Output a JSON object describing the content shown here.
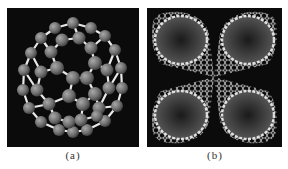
{
  "figure": {
    "panels": [
      {
        "id": "a",
        "caption": "(a)",
        "subject": "C60 fullerene ball-and-stick model",
        "background": "#0b0b0b",
        "atom_color": "#7a7a7a",
        "bond_color": "#e6e6e6"
      },
      {
        "id": "b",
        "caption": "(b)",
        "subject": "four carbon nanotubes converging at center",
        "background": "#0b0b0b",
        "lattice_color": "#d8d8d8"
      }
    ]
  }
}
